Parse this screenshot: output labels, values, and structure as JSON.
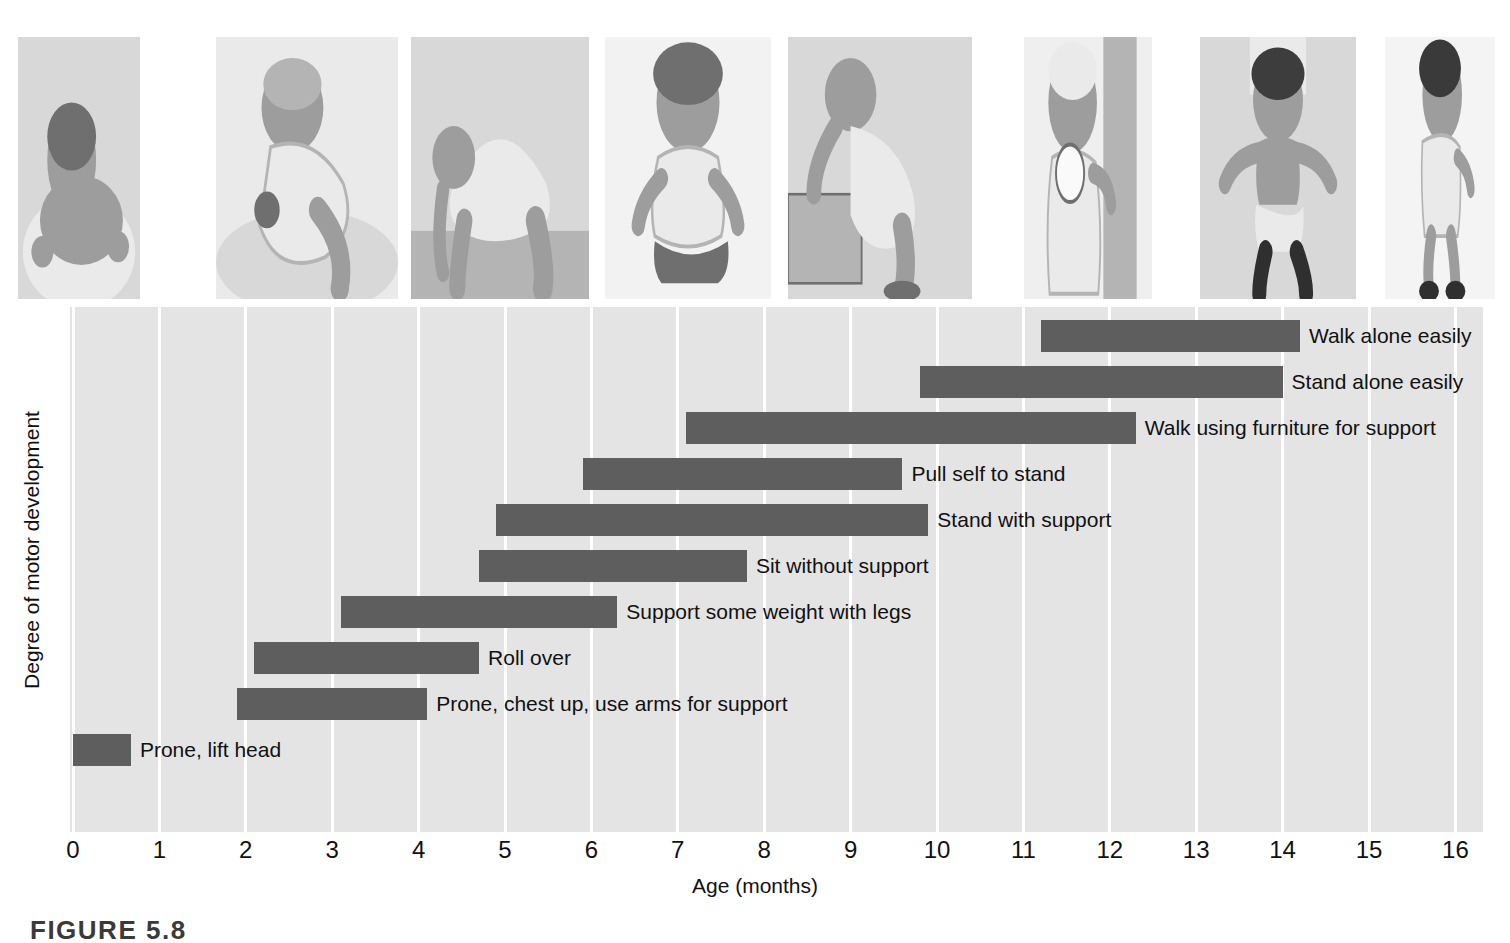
{
  "figure": {
    "caption": "FIGURE 5.8"
  },
  "photo_strip": {
    "photos": [
      {
        "name": "photo-prone-lift-head",
        "alt": "Infant lying prone lifting head and smiling"
      },
      {
        "name": "photo-roll-over",
        "alt": "Infant rolling over on a blanket"
      },
      {
        "name": "photo-support-weight-with-legs",
        "alt": "Infant bearing weight on hands and feet"
      },
      {
        "name": "photo-sit-without-support",
        "alt": "Infant sitting unsupported on the floor"
      },
      {
        "name": "photo-pull-self-to-stand",
        "alt": "Infant pulling self up on a low bench"
      },
      {
        "name": "photo-stand-with-support",
        "alt": "Smiling infant standing holding a curtain"
      },
      {
        "name": "photo-walk-with-help",
        "alt": "Toddler walking while held by an adult's hands"
      },
      {
        "name": "photo-walk-alone",
        "alt": "Toddler walking alone in profile"
      }
    ]
  },
  "chart_data": {
    "type": "bar",
    "orientation": "horizontal",
    "title": "",
    "xlabel": "Age (months)",
    "ylabel": "Degree of motor development",
    "xlim": [
      0,
      16
    ],
    "xticks": [
      "0",
      "1",
      "2",
      "3",
      "4",
      "5",
      "6",
      "7",
      "8",
      "9",
      "10",
      "11",
      "12",
      "13",
      "14",
      "15",
      "16"
    ],
    "grid": "vertical",
    "legend": "none",
    "bar_color": "#5e5e5e",
    "plot_background": "#e4e4e4",
    "gridline_color": "#ffffff",
    "note": "Each bar spans the age range in months over which the milestone typically emerges; bars are ordered bottom-to-top by age of onset.",
    "milestones": [
      {
        "label": "Walk alone easily",
        "start": 11.2,
        "end": 14.2
      },
      {
        "label": "Stand alone easily",
        "start": 9.8,
        "end": 14.0
      },
      {
        "label": "Walk using furniture for support",
        "start": 7.1,
        "end": 12.3
      },
      {
        "label": "Pull self to stand",
        "start": 5.9,
        "end": 9.6
      },
      {
        "label": "Stand with support",
        "start": 4.9,
        "end": 9.9
      },
      {
        "label": "Sit without support",
        "start": 4.7,
        "end": 7.8
      },
      {
        "label": "Support some weight with legs",
        "start": 3.1,
        "end": 6.3
      },
      {
        "label": "Roll over",
        "start": 2.1,
        "end": 4.7
      },
      {
        "label": "Prone, chest up, use arms for support",
        "start": 1.9,
        "end": 4.1
      },
      {
        "label": "Prone, lift head",
        "start": 0.0,
        "end": 0.67
      }
    ]
  }
}
